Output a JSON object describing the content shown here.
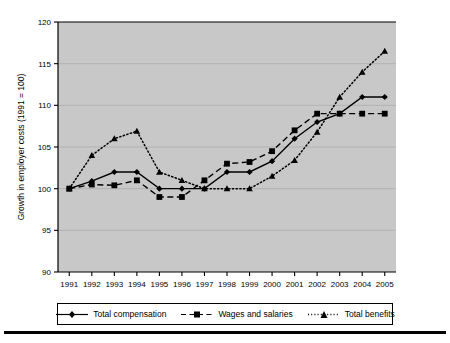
{
  "chart_data": {
    "type": "line",
    "title": "",
    "xlabel": "",
    "ylabel": "Growth in employer costs (1991 = 100)",
    "x": [
      1991,
      1992,
      1993,
      1994,
      1995,
      1996,
      1997,
      1998,
      1999,
      2000,
      2001,
      2002,
      2003,
      2004,
      2005
    ],
    "categories": [
      "1991",
      "1992",
      "1993",
      "1994",
      "1995",
      "1996",
      "1997",
      "1998",
      "1999",
      "2000",
      "2001",
      "2002",
      "2003",
      "2004",
      "2005"
    ],
    "xlim": [
      1990.5,
      2005.5
    ],
    "ylim": [
      90,
      120
    ],
    "yticks": [
      90,
      95,
      100,
      105,
      110,
      115,
      120
    ],
    "ytick_labels": [
      "90",
      "95",
      "100",
      "105",
      "110",
      "115",
      "120"
    ],
    "grid": true,
    "grid_axis": "y",
    "legend_position": "bottom",
    "plot_background": "#c8c8c8",
    "series": [
      {
        "name": "Total compensation",
        "marker": "diamond",
        "linestyle": "solid",
        "color": "#000000",
        "values": [
          100.0,
          100.9,
          102.0,
          102.0,
          100.0,
          100.0,
          100.0,
          102.0,
          102.0,
          103.3,
          106.0,
          108.0,
          109.0,
          111.0,
          111.0
        ]
      },
      {
        "name": "Wages and salaries",
        "marker": "square",
        "linestyle": "dashed",
        "color": "#000000",
        "values": [
          100.0,
          100.5,
          100.4,
          101.0,
          99.0,
          99.0,
          101.0,
          103.0,
          103.2,
          104.5,
          107.0,
          109.0,
          109.0,
          109.0,
          109.0
        ]
      },
      {
        "name": "Total benefits",
        "marker": "triangle",
        "linestyle": "dotted",
        "color": "#000000",
        "values": [
          100.0,
          104.0,
          106.0,
          106.9,
          102.0,
          101.0,
          100.0,
          100.0,
          100.0,
          101.5,
          103.4,
          106.8,
          111.0,
          114.0,
          116.5
        ]
      }
    ]
  },
  "legend": {
    "items": [
      {
        "label": "Total compensation",
        "marker": "diamond",
        "linestyle": "solid"
      },
      {
        "label": "Wages and salaries",
        "marker": "square",
        "linestyle": "dashed"
      },
      {
        "label": "Total benefits",
        "marker": "triangle",
        "linestyle": "dotted"
      }
    ]
  }
}
